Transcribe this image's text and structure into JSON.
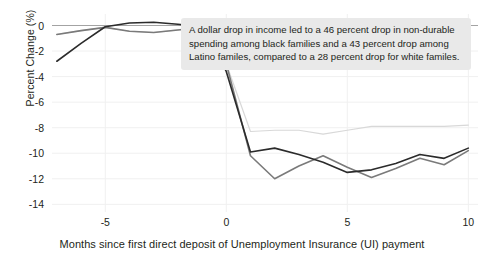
{
  "chart_data": {
    "type": "line",
    "title": "",
    "xlabel": "Months since first direct deposit of Unemployment Insurance (UI) payment",
    "ylabel": "Percent Change (%)",
    "xlim": [
      -7.2,
      10.4
    ],
    "ylim": [
      -14.6,
      0.9
    ],
    "xticks": [
      -5,
      0,
      5,
      10
    ],
    "xtick_labels": [
      "-5",
      "0",
      "5",
      "10"
    ],
    "yticks": [
      0,
      -2,
      -4,
      -6,
      -8,
      -10,
      -12,
      -14
    ],
    "ytick_labels": [
      "0",
      "-2",
      "-4",
      "-6",
      "-8",
      "-10",
      "-12",
      "-14"
    ],
    "grid": true,
    "legend": "none",
    "x": [
      -7,
      -6,
      -5,
      -4,
      -3,
      -2,
      -1,
      0,
      1,
      2,
      3,
      4,
      5,
      6,
      7,
      8,
      9,
      10
    ],
    "series": [
      {
        "name": "Black families",
        "color": "#2b2b2b",
        "values": [
          -2.8,
          -1.4,
          -0.1,
          0.2,
          0.25,
          0.1,
          -0.1,
          -3.6,
          -9.9,
          -9.6,
          -10.1,
          -10.7,
          -11.5,
          -11.3,
          -10.8,
          -10.1,
          -10.4,
          -9.6
        ]
      },
      {
        "name": "Latino families",
        "color": "#7a7a7a",
        "values": [
          -0.7,
          -0.4,
          -0.15,
          -0.45,
          -0.55,
          -0.35,
          -0.15,
          -3.0,
          -10.2,
          -12.0,
          -11.0,
          -10.2,
          -11.1,
          -11.9,
          -11.2,
          -10.4,
          -10.9,
          -9.8
        ]
      },
      {
        "name": "White families",
        "color": "#d8d8d8",
        "values": [
          -0.7,
          -0.4,
          -0.15,
          -0.45,
          -0.55,
          -0.35,
          -0.15,
          -3.0,
          -8.3,
          -8.2,
          -8.2,
          -8.5,
          -8.2,
          -7.9,
          -7.9,
          -7.9,
          -7.9,
          -7.8
        ]
      }
    ],
    "annotation": {
      "line1": "A dollar drop in income led to a 46 percent drop in non-durable",
      "line2": "spending among black families and a 43 percent drop among",
      "line3": "Latino familes, compared to a 28 percent drop for white familes."
    }
  }
}
